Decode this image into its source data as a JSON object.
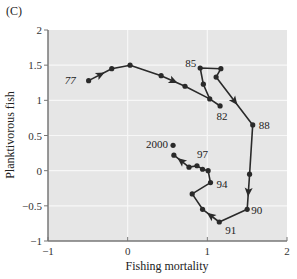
{
  "panel_label": "(C)",
  "colors": {
    "plot_bg": "#e6e6e6",
    "grid": "#f7f7f7",
    "axis": "#777777",
    "line": "#2a2a2a"
  },
  "chart_data": {
    "type": "line",
    "title": "",
    "panel": "(C)",
    "xlabel": "Fishing mortality",
    "ylabel": "Planktivorous fish",
    "xlim": [
      -1,
      2
    ],
    "ylim": [
      -1,
      2
    ],
    "xticks": [
      -1,
      0,
      1,
      2
    ],
    "yticks": [
      -1,
      -0.5,
      0,
      0.5,
      1,
      1.5,
      2
    ],
    "xtick_labels": [
      "−1",
      "0",
      "1",
      "2"
    ],
    "ytick_labels": [
      "−1",
      "−0.5",
      "0",
      "0.5",
      "1",
      "1.5",
      "2"
    ],
    "grid": true,
    "legend": null,
    "series": [
      {
        "name": "Trajectory 1977-2000",
        "points": [
          {
            "x": -0.49,
            "y": 1.28,
            "label": "77"
          },
          {
            "x": -0.2,
            "y": 1.45,
            "label": ""
          },
          {
            "x": 0.03,
            "y": 1.5,
            "label": ""
          },
          {
            "x": 0.42,
            "y": 1.35,
            "label": ""
          },
          {
            "x": 0.72,
            "y": 1.2,
            "label": ""
          },
          {
            "x": 1.03,
            "y": 1.02,
            "label": ""
          },
          {
            "x": 1.16,
            "y": 0.92,
            "label": "82"
          },
          {
            "x": 1.03,
            "y": 1.02,
            "label": ""
          },
          {
            "x": 0.95,
            "y": 1.23,
            "label": ""
          },
          {
            "x": 0.91,
            "y": 1.46,
            "label": "85"
          },
          {
            "x": 1.17,
            "y": 1.45,
            "label": ""
          },
          {
            "x": 1.11,
            "y": 1.33,
            "label": ""
          },
          {
            "x": 1.57,
            "y": 0.65,
            "label": "88"
          },
          {
            "x": 1.53,
            "y": -0.05,
            "label": ""
          },
          {
            "x": 1.5,
            "y": -0.55,
            "label": "90"
          },
          {
            "x": 1.15,
            "y": -0.73,
            "label": "91"
          },
          {
            "x": 0.94,
            "y": -0.55,
            "label": ""
          },
          {
            "x": 0.81,
            "y": -0.33,
            "label": ""
          },
          {
            "x": 1.04,
            "y": -0.17,
            "label": "94"
          },
          {
            "x": 1.01,
            "y": 0.0,
            "label": ""
          },
          {
            "x": 0.94,
            "y": 0.02,
            "label": ""
          },
          {
            "x": 0.87,
            "y": 0.07,
            "label": "97"
          },
          {
            "x": 0.77,
            "y": 0.05,
            "label": ""
          },
          {
            "x": 0.58,
            "y": 0.22,
            "label": ""
          }
        ],
        "extra_points": [
          {
            "x": 0.57,
            "y": 0.36,
            "label": "2000"
          }
        ],
        "arrows_on_segments": [
          0,
          3,
          11,
          13,
          15,
          22
        ]
      }
    ],
    "annotations": [
      "77",
      "82",
      "85",
      "88",
      "90",
      "91",
      "94",
      "97",
      "2000"
    ]
  }
}
